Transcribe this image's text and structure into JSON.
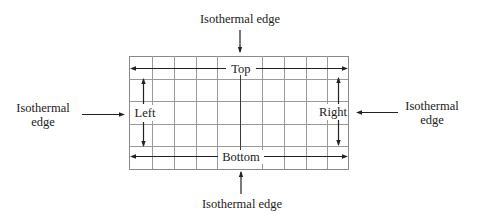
{
  "diagram": {
    "type": "grid-boundary-conditions",
    "grid": {
      "left": 129,
      "top": 56,
      "right": 348,
      "bottom": 169,
      "columns_x": [
        129,
        152,
        174,
        196,
        217,
        262,
        284,
        306,
        327,
        348
      ],
      "rows_y": [
        56,
        79,
        101,
        124,
        146,
        169
      ],
      "center_axis_x": 240
    },
    "inner_labels": {
      "top": "Top",
      "bottom": "Bottom",
      "left": "Left",
      "right": "Right"
    },
    "outer_labels": {
      "top": "Isothermal edge",
      "bottom": "Isothermal edge",
      "left_line1": "Isothermal",
      "left_line2": "edge",
      "right_line1": "Isothermal",
      "right_line2": "edge"
    },
    "colors": {
      "grid": "#9a9a9a",
      "ink": "#222222",
      "background": "#ffffff"
    }
  }
}
